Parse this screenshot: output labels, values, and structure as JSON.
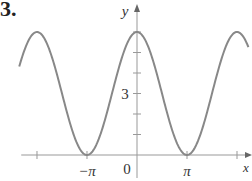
{
  "problem_number": "3.",
  "chart_data": {
    "type": "line",
    "title": "",
    "function_description": "y = 3 + 3cos(x)",
    "xlabel": "x",
    "ylabel": "y",
    "x_tick_labels": [
      "−π",
      "0",
      "π"
    ],
    "x_ticks": [
      -6.2832,
      -3.1416,
      3.1416,
      6.2832
    ],
    "y_tick_labels": [
      "3"
    ],
    "y_ticks": [
      1,
      2,
      3,
      4,
      5,
      6
    ],
    "xlim": [
      -7.4,
      7.0
    ],
    "ylim": [
      0,
      6.8
    ],
    "series": [
      {
        "name": "curve",
        "x": [
          -7.4,
          -6.2832,
          -4.7124,
          -3.1416,
          -1.5708,
          0,
          1.5708,
          3.1416,
          4.7124,
          6.2832,
          7.0
        ],
        "values": [
          4.31,
          6,
          3,
          0,
          3,
          6,
          3,
          0,
          3,
          6,
          5.27
        ]
      }
    ],
    "grid": false,
    "legend": null,
    "colors": {
      "curve": "#888888",
      "axes": "#999999",
      "text": "#333333"
    }
  }
}
